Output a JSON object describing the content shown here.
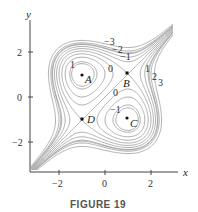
{
  "figure": {
    "caption": "FIGURE 19",
    "axes": {
      "x_label": "x",
      "y_label": "y",
      "x_ticks": [
        {
          "value": -2,
          "label": "−2"
        },
        {
          "value": 0,
          "label": "0"
        },
        {
          "value": 2,
          "label": "2"
        }
      ],
      "y_ticks": [
        {
          "value": 2,
          "label": "2"
        },
        {
          "value": 0,
          "label": "0"
        },
        {
          "value": -2,
          "label": "−2"
        }
      ]
    },
    "points": [
      {
        "name": "A",
        "x": -1,
        "y": 1
      },
      {
        "name": "B",
        "x": 1,
        "y": 1
      },
      {
        "name": "C",
        "x": 1,
        "y": -1
      },
      {
        "name": "D",
        "x": -1,
        "y": -1
      }
    ],
    "contour_labels": {
      "top_m3": "−3",
      "top_m2": "−2",
      "top_m1": "−1",
      "right_1": "1",
      "right_2": "2",
      "right_3": "3",
      "zero_upper": "0",
      "zero_lower": "0",
      "circle_A": "1",
      "circle_C": "−1"
    },
    "line_color": "#9a9a9a",
    "axis_color": "#444444"
  }
}
